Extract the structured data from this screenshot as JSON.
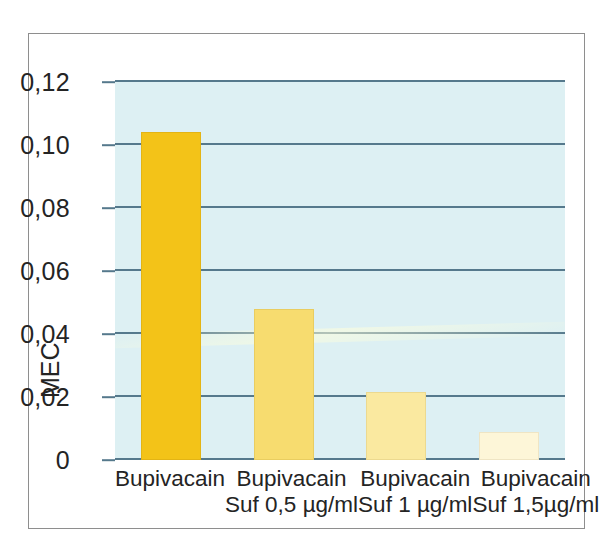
{
  "figure": {
    "background_color": "#ffffff",
    "frame_color": "#8e8e8e",
    "plot_background_color": "#ddf0f3",
    "gridline_color": "#55798c",
    "text_color": "#242424"
  },
  "chart_data": {
    "type": "bar",
    "title": "",
    "xlabel": "",
    "ylabel": "MEC",
    "ylim": [
      0,
      0.12
    ],
    "grid": true,
    "legend": "none",
    "decimal_separator": ",",
    "categories": [
      "Bupivacain",
      "Bupivacain Suf 0,5 µg/ml",
      "Bupivacain Suf 1 µg/ml",
      "Bupivacain Suf 1,5µg/ml"
    ],
    "category_lines": [
      {
        "line1": "Bupivacain",
        "line2": ""
      },
      {
        "line1": "Bupivacain",
        "line2": "Suf 0,5 µg/ml"
      },
      {
        "line1": "Bupivacain",
        "line2": "Suf 1 µg/ml"
      },
      {
        "line1": "Bupivacain",
        "line2": "Suf 1,5µg/ml"
      }
    ],
    "values": [
      0.104,
      0.048,
      0.0215,
      0.009
    ],
    "bar_colors": [
      "#f3c318",
      "#f7dc6f",
      "#fae9a0",
      "#fdf6d8"
    ],
    "bar_border_colors": [
      "#e3b415",
      "#e9cd60",
      "#ecd98f",
      "#efe5c4"
    ],
    "yticks": [
      0,
      0.02,
      0.04,
      0.06,
      0.08,
      0.1,
      0.12
    ],
    "ytick_labels": [
      "0",
      "0,02",
      "0,04",
      "0,06",
      "0,08",
      "0,10",
      "0,12"
    ]
  }
}
